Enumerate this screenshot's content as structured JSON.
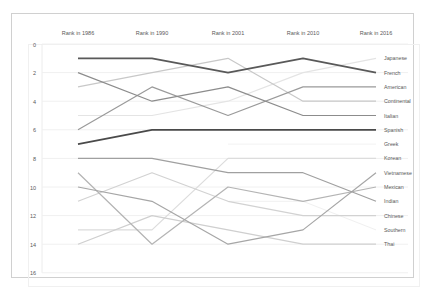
{
  "chart_data": {
    "type": "line",
    "title": "",
    "xlabel": "",
    "ylabel": "",
    "categories": [
      "Rank in 1986",
      "Rank in 1990",
      "Rank in 2001",
      "Rank in 2010",
      "Rank in 2016"
    ],
    "ylim": [
      0,
      16
    ],
    "y_inverted": true,
    "yticks": [
      0,
      2,
      4,
      6,
      8,
      10,
      12,
      14,
      16
    ],
    "grid": true,
    "legend_position": "right-end-labels",
    "series": [
      {
        "name": "Japanese",
        "values": [
          5,
          5,
          4,
          2,
          1
        ],
        "color": "#e4e4e4",
        "width": 1.2
      },
      {
        "name": "French",
        "values": [
          1,
          1,
          2,
          1,
          2
        ],
        "color": "#595959",
        "width": 1.8
      },
      {
        "name": "American",
        "values": [
          6,
          3,
          5,
          3,
          3
        ],
        "color": "#9a9a9a",
        "width": 1.2
      },
      {
        "name": "Continental",
        "values": [
          3,
          2,
          1,
          4,
          4
        ],
        "color": "#c8c8c8",
        "width": 1.2
      },
      {
        "name": "Italian",
        "values": [
          2,
          4,
          3,
          5,
          5
        ],
        "color": "#8c8c8c",
        "width": 1.2
      },
      {
        "name": "Spanish",
        "values": [
          7,
          6,
          6,
          6,
          6
        ],
        "color": "#4a4a4a",
        "width": 1.8
      },
      {
        "name": "Greek",
        "values": [
          null,
          null,
          7,
          7,
          7
        ],
        "color": "#f2f2f2",
        "width": 1.0
      },
      {
        "name": "Korean",
        "values": [
          13,
          13,
          8,
          8,
          8
        ],
        "color": "#dcdcdc",
        "width": 1.2
      },
      {
        "name": "Vietnamese",
        "values": [
          10,
          11,
          14,
          13,
          9
        ],
        "color": "#a6a6a6",
        "width": 1.2
      },
      {
        "name": "Mexican",
        "values": [
          9,
          14,
          10,
          11,
          10
        ],
        "color": "#b4b4b4",
        "width": 1.2
      },
      {
        "name": "Indian",
        "values": [
          8,
          8,
          9,
          9,
          11
        ],
        "color": "#a0a0a0",
        "width": 1.2
      },
      {
        "name": "Chinese",
        "values": [
          11,
          9,
          11,
          12,
          12
        ],
        "color": "#d2d2d2",
        "width": 1.2
      },
      {
        "name": "Southern",
        "values": [
          null,
          null,
          11,
          11,
          13
        ],
        "color": "#f0f0f0",
        "width": 1.0
      },
      {
        "name": "Thai",
        "values": [
          14,
          12,
          13,
          14,
          14
        ],
        "color": "#cfcfcf",
        "width": 1.2
      }
    ]
  }
}
